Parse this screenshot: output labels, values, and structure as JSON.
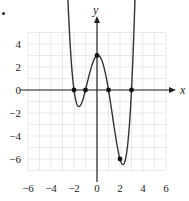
{
  "chart_data": {
    "type": "line",
    "title": "",
    "xlabel": "x",
    "ylabel": "y",
    "xlim": [
      -6,
      6
    ],
    "ylim": [
      -7,
      5
    ],
    "grid": true,
    "x_ticks": [
      "−6",
      "−4",
      "−2",
      "0",
      "2",
      "4",
      "6"
    ],
    "y_ticks": [
      "4",
      "2",
      "0",
      "−2",
      "−4",
      "−6"
    ],
    "function": "f(x) = (x+2)(x+1)(x−1)(x−3)/2",
    "marked_points": [
      {
        "x": -2,
        "y": 0
      },
      {
        "x": -1,
        "y": 0
      },
      {
        "x": 0,
        "y": 3
      },
      {
        "x": 1,
        "y": 0
      },
      {
        "x": 3,
        "y": 0
      },
      {
        "x": 2,
        "y": -6
      }
    ],
    "ends": "both ends arrow upward"
  },
  "labels": {
    "x_axis": "x",
    "y_axis": "y",
    "xt": [
      "−6",
      "−4",
      "−2",
      "0",
      "2",
      "4",
      "6"
    ],
    "yt": [
      "4",
      "2",
      "0",
      "−2",
      "−4",
      "−6"
    ]
  },
  "colors": {
    "curve": "#333333",
    "grid": "#dcdcdc",
    "axis": "#222222"
  }
}
